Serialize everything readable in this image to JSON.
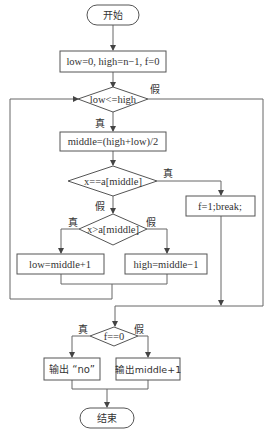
{
  "diagram": {
    "type": "flowchart",
    "title": "",
    "nodes": {
      "start": {
        "kind": "terminal",
        "label": "开始"
      },
      "init": {
        "kind": "process",
        "label": "low=0, high=n−1, f=0"
      },
      "loop_cond": {
        "kind": "decision",
        "label": "low<=high"
      },
      "calc_mid": {
        "kind": "process",
        "label": "middle=(high+low)/2"
      },
      "eq_cond": {
        "kind": "decision",
        "label": "x==a[middle]"
      },
      "found": {
        "kind": "process",
        "label": "f=1;break;"
      },
      "gt_cond": {
        "kind": "decision",
        "label": "x>a[middle]"
      },
      "move_low": {
        "kind": "process",
        "label": "low=middle+1"
      },
      "move_high": {
        "kind": "process",
        "label": "high=middle−1"
      },
      "flag_cond": {
        "kind": "decision",
        "label": "f==0"
      },
      "out_no": {
        "kind": "process",
        "label": "输出 “no”"
      },
      "out_pos": {
        "kind": "process",
        "label": "输出middle+1"
      },
      "end": {
        "kind": "terminal",
        "label": "结束"
      }
    },
    "branch_labels": {
      "true": "真",
      "false": "假"
    },
    "edges": [
      {
        "from": "start",
        "to": "init"
      },
      {
        "from": "init",
        "to": "loop_cond"
      },
      {
        "from": "loop_cond",
        "to": "calc_mid",
        "label": "真"
      },
      {
        "from": "loop_cond",
        "to": "flag_cond",
        "label": "假"
      },
      {
        "from": "calc_mid",
        "to": "eq_cond"
      },
      {
        "from": "eq_cond",
        "to": "found",
        "label": "真"
      },
      {
        "from": "eq_cond",
        "to": "gt_cond",
        "label": "假"
      },
      {
        "from": "gt_cond",
        "to": "move_low",
        "label": "真"
      },
      {
        "from": "gt_cond",
        "to": "move_high",
        "label": "假"
      },
      {
        "from": "move_low",
        "to": "loop_cond"
      },
      {
        "from": "move_high",
        "to": "loop_cond"
      },
      {
        "from": "found",
        "to": "flag_cond"
      },
      {
        "from": "flag_cond",
        "to": "out_no",
        "label": "真"
      },
      {
        "from": "flag_cond",
        "to": "out_pos",
        "label": "假"
      },
      {
        "from": "out_no",
        "to": "end"
      },
      {
        "from": "out_pos",
        "to": "end"
      }
    ]
  }
}
